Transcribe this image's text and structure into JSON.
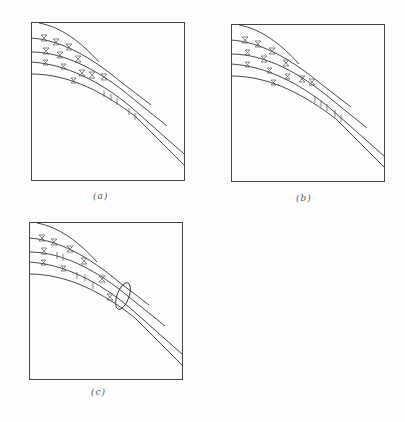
{
  "figure": {
    "panels": [
      {
        "id": "a",
        "caption": "(a)",
        "has_ellipse": false
      },
      {
        "id": "b",
        "caption": "(b)",
        "has_ellipse": false
      },
      {
        "id": "c",
        "caption": "(c)",
        "has_ellipse": true
      }
    ],
    "colors": {
      "line": "#333333",
      "frame": "#444444",
      "background": "#fdfdfd"
    }
  }
}
